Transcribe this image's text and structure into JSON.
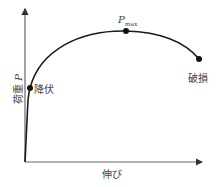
{
  "diagram": {
    "type": "load-elongation curve",
    "x_axis_label": "伸び",
    "y_axis_label_text": "荷重",
    "y_axis_label_symbol": "P",
    "points": {
      "yield": {
        "label": "降伏"
      },
      "max": {
        "label_symbol": "P",
        "label_subscript": "max"
      },
      "fracture": {
        "label": "破損"
      }
    },
    "colors": {
      "curve": "#1a1a1a",
      "axis": "#666666",
      "text": "#444444"
    }
  }
}
